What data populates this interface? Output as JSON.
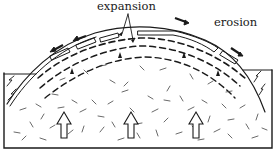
{
  "diagram": {
    "type": "cross-section",
    "labels": {
      "expansion": "expansion",
      "erosion": "erosion"
    },
    "elements": {
      "upward_arrows": 3,
      "dashed_sheet_joints": 3,
      "surface_slabs": "sliding sheets on dome surface",
      "slide_arrows": 4
    },
    "colors": {
      "line": "#1a1a1a",
      "background": "#ffffff"
    }
  }
}
